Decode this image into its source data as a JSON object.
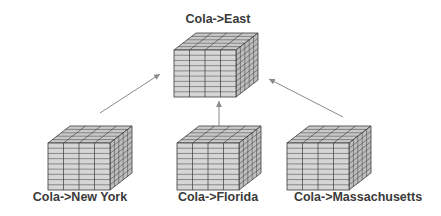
{
  "diagram": {
    "top": {
      "label": "Cola->East"
    },
    "bottom": [
      {
        "label": "Cola->New York"
      },
      {
        "label": "Cola->Florida"
      },
      {
        "label": "Cola->Massachusetts"
      }
    ],
    "colors": {
      "cube_fill_front": "#d6d6d6",
      "cube_fill_top": "#c9c9c9",
      "cube_fill_side": "#bdbdbd",
      "grid_line": "#3a3a3a",
      "arrow": "#8a8a8a",
      "label": "#3a3a3a"
    },
    "cube_grid": {
      "columns": 4,
      "rows": 9,
      "depth": 5
    }
  }
}
